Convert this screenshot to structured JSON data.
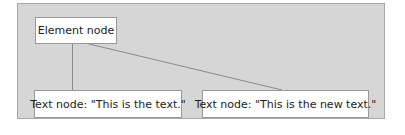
{
  "diagram": {
    "type": "tree",
    "background_color": "#d6d6d6",
    "nodes": [
      {
        "id": "element",
        "label": "Element node"
      },
      {
        "id": "text1",
        "label": "Text node: \"This is the text.\""
      },
      {
        "id": "text2",
        "label": "Text node: \"This is the new text.\""
      }
    ],
    "edges": [
      {
        "from": "element",
        "to": "text1"
      },
      {
        "from": "element",
        "to": "text2"
      }
    ]
  }
}
